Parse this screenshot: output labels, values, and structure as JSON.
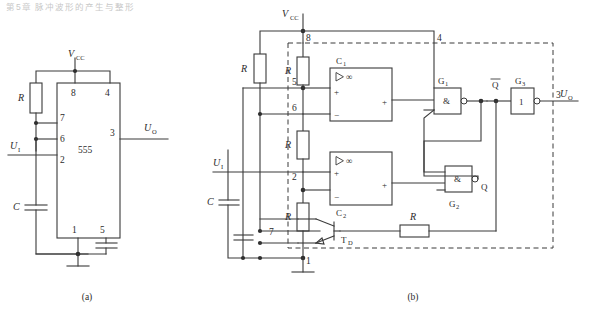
{
  "figure": {
    "page_header": "第5章 脉冲波形的产生与整形",
    "captions": {
      "a": "(a)",
      "b": "(b)"
    }
  },
  "circuit_a": {
    "title": "555 monostable application circuit",
    "chip_label": "555",
    "supply_label": "V",
    "supply_sub": "CC",
    "input_label": "U",
    "input_sub": "I",
    "output_label": "U",
    "output_sub": "O",
    "resistor_label": "R",
    "capacitor_label": "C",
    "pins": [
      {
        "number": "8",
        "name": "vcc",
        "position": "top-left"
      },
      {
        "number": "4",
        "name": "reset",
        "position": "top-right"
      },
      {
        "number": "7",
        "name": "discharge",
        "position": "left-1"
      },
      {
        "number": "6",
        "name": "threshold",
        "position": "left-2"
      },
      {
        "number": "2",
        "name": "trigger",
        "position": "left-3"
      },
      {
        "number": "3",
        "name": "output",
        "position": "right"
      },
      {
        "number": "1",
        "name": "ground",
        "position": "bottom-left"
      },
      {
        "number": "5",
        "name": "control-voltage",
        "position": "bottom-right"
      }
    ]
  },
  "circuit_b": {
    "title": "555 internal block diagram",
    "supply_label": "V",
    "supply_sub": "CC",
    "input_label": "U",
    "input_sub": "I",
    "output_label": "U",
    "output_sub": "O",
    "external_resistor_label": "R",
    "external_capacitor_label": "C",
    "divider_resistor_label": "R",
    "feedback_resistor_label": "R",
    "comparators": [
      {
        "name": "C",
        "sub": "1",
        "symbol": "∞",
        "in_plus": "+",
        "in_minus": "−",
        "out": "+"
      },
      {
        "name": "C",
        "sub": "2",
        "symbol": "∞",
        "in_plus": "+",
        "in_minus": "−",
        "out": "+"
      }
    ],
    "gates": [
      {
        "name": "G",
        "sub": "1",
        "glyph": "&",
        "type": "nand"
      },
      {
        "name": "G",
        "sub": "2",
        "glyph": "&",
        "type": "nand"
      },
      {
        "name": "G",
        "sub": "3",
        "glyph": "1",
        "type": "inverter"
      }
    ],
    "latch_outputs": {
      "q_bar": "Q",
      "q": "Q"
    },
    "transistor": {
      "name": "T",
      "sub": "D"
    },
    "pins": [
      {
        "number": "8",
        "name": "vcc"
      },
      {
        "number": "4",
        "name": "reset"
      },
      {
        "number": "5",
        "name": "control-voltage"
      },
      {
        "number": "6",
        "name": "threshold"
      },
      {
        "number": "2",
        "name": "trigger"
      },
      {
        "number": "7",
        "name": "discharge"
      },
      {
        "number": "1",
        "name": "ground"
      },
      {
        "number": "3",
        "name": "output"
      }
    ]
  },
  "colors": {
    "wire": "#3a3a3a",
    "text": "#2b2b2b",
    "background": "#ffffff",
    "node": "#2e2e2e"
  }
}
